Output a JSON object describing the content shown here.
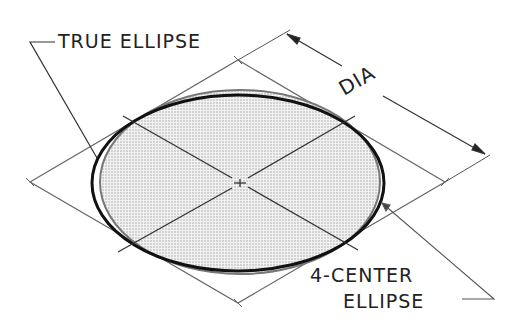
{
  "diagram": {
    "labels": {
      "true_ellipse": "TRUE ELLIPSE",
      "dia": "DIA",
      "four_center_line1": "4-CENTER",
      "four_center_line2": "ELLIPSE"
    },
    "geometry": {
      "rhombus": {
        "left": [
          30,
          182
        ],
        "top": [
          238,
          60
        ],
        "right": [
          445,
          182
        ],
        "bottom": [
          238,
          303
        ]
      },
      "center": [
        240,
        183
      ]
    },
    "colors": {
      "line": "#555555",
      "ellipse": "#111111",
      "fill": "#d9d9d9",
      "text": "#222222"
    }
  }
}
